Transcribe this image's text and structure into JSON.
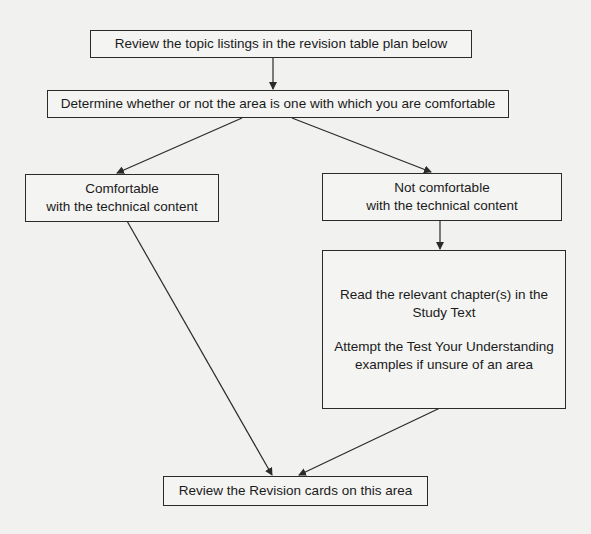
{
  "flowchart": {
    "nodes": {
      "review_listings": {
        "text": "Review the topic listings in the revision table plan below"
      },
      "determine": {
        "text": "Determine whether or not the area is one with which you are comfortable"
      },
      "comfortable": {
        "line1": "Comfortable",
        "line2": "with the technical content"
      },
      "not_comfortable": {
        "line1": "Not comfortable",
        "line2": "with the technical content"
      },
      "study": {
        "line1": "Read the relevant chapter(s) in the",
        "line2": "Study Text",
        "line3": "Attempt the Test Your Understanding",
        "line4": "examples if unsure of an area"
      },
      "review_cards": {
        "text": "Review the Revision cards on this area"
      }
    },
    "edges": [
      {
        "from": "review_listings",
        "to": "determine"
      },
      {
        "from": "determine",
        "to": "comfortable"
      },
      {
        "from": "determine",
        "to": "not_comfortable"
      },
      {
        "from": "not_comfortable",
        "to": "study"
      },
      {
        "from": "comfortable",
        "to": "review_cards"
      },
      {
        "from": "study",
        "to": "review_cards"
      }
    ],
    "colors": {
      "line": "#2a2a2a",
      "box_fill": "#f4f4f2",
      "background": "#f1f1ef"
    }
  }
}
